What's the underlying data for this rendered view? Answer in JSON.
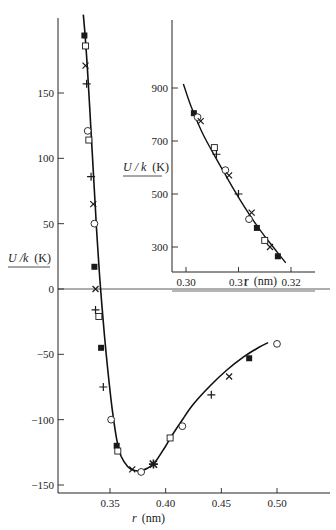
{
  "chart_data": [
    {
      "id": "main",
      "type": "scatter",
      "title": "",
      "xlabel": "r (nm)",
      "ylabel": "U / k (K)",
      "xlim": [
        0.305,
        0.525
      ],
      "ylim": [
        -150,
        205
      ],
      "xticks": [
        0.35,
        0.4,
        0.45,
        0.5
      ],
      "xtick_labels": [
        "0.35",
        "0.40",
        "0.45",
        "0.50"
      ],
      "yticks": [
        150,
        100,
        50,
        0,
        -50,
        -100,
        -150
      ],
      "ytick_labels": [
        "150",
        "100",
        "50",
        "0",
        "−50",
        "−100",
        "−150"
      ],
      "grid": false,
      "zero_line": true,
      "curve": {
        "description": "smooth fitted potential curve through all points",
        "x": [
          0.326,
          0.328,
          0.33,
          0.332,
          0.334,
          0.336,
          0.338,
          0.34,
          0.342,
          0.345,
          0.348,
          0.352,
          0.356,
          0.36,
          0.366,
          0.372,
          0.378,
          0.384,
          0.39,
          0.398,
          0.405,
          0.415,
          0.425,
          0.44,
          0.455,
          0.47,
          0.483,
          0.492
        ],
        "y": [
          210,
          190,
          165,
          135,
          105,
          75,
          45,
          18,
          -5,
          -35,
          -62,
          -92,
          -115,
          -128,
          -136,
          -139,
          -139,
          -137,
          -133,
          -123,
          -113,
          -100,
          -88,
          -74,
          -62,
          -52,
          -45,
          -41
        ]
      },
      "series": [
        {
          "name": "filled-square",
          "marker": "filled-square",
          "x": [
            0.327,
            0.336,
            0.342,
            0.356,
            0.475
          ],
          "y": [
            194,
            17,
            -45,
            -120,
            -53
          ]
        },
        {
          "name": "open-square",
          "marker": "open-square",
          "x": [
            0.328,
            0.331,
            0.34,
            0.357,
            0.404
          ],
          "y": [
            186,
            114,
            -21,
            -124,
            -114
          ]
        },
        {
          "name": "cross",
          "marker": "cross",
          "x": [
            0.328,
            0.335,
            0.337,
            0.37,
            0.457
          ],
          "y": [
            171,
            65,
            0,
            -138,
            -67
          ]
        },
        {
          "name": "plus",
          "marker": "plus",
          "x": [
            0.329,
            0.333,
            0.337,
            0.344,
            0.441
          ],
          "y": [
            157,
            86,
            -16,
            -75,
            -81
          ]
        },
        {
          "name": "open-circle",
          "marker": "open-circle",
          "x": [
            0.33,
            0.336,
            0.351,
            0.378,
            0.415,
            0.5
          ],
          "y": [
            121,
            50,
            -100,
            -140,
            -105,
            -42
          ]
        },
        {
          "name": "asterisk",
          "marker": "asterisk",
          "x": [
            0.389
          ],
          "y": [
            -134
          ]
        }
      ]
    },
    {
      "id": "inset",
      "type": "scatter",
      "title": "",
      "xlabel": "r (nm)",
      "ylabel": "U / k (K)",
      "xlim": [
        0.297,
        0.325
      ],
      "ylim": [
        250,
        1010
      ],
      "xticks": [
        0.3,
        0.31,
        0.32
      ],
      "xtick_labels": [
        "0.30",
        "0.31",
        "0.32"
      ],
      "yticks": [
        900,
        700,
        500,
        300
      ],
      "ytick_labels": [
        "900",
        "700",
        "500",
        "300"
      ],
      "grid": false,
      "curve": {
        "x": [
          0.2995,
          0.301,
          0.303,
          0.305,
          0.307,
          0.309,
          0.311,
          0.313,
          0.315,
          0.317,
          0.319
        ],
        "y": [
          915,
          828,
          735,
          660,
          590,
          520,
          455,
          395,
          340,
          290,
          240
        ]
      },
      "series": [
        {
          "name": "filled-square",
          "marker": "filled-square",
          "x": [
            0.3015,
            0.3135,
            0.3175
          ],
          "y": [
            805,
            372,
            265
          ]
        },
        {
          "name": "open-circle",
          "marker": "open-circle",
          "x": [
            0.3022,
            0.3075,
            0.312
          ],
          "y": [
            790,
            590,
            405
          ]
        },
        {
          "name": "open-square",
          "marker": "open-square",
          "x": [
            0.3054,
            0.315
          ],
          "y": [
            675,
            325
          ]
        },
        {
          "name": "cross",
          "marker": "cross",
          "x": [
            0.3028,
            0.3082,
            0.3125,
            0.316
          ],
          "y": [
            775,
            570,
            430,
            300
          ]
        },
        {
          "name": "plus",
          "marker": "plus",
          "x": [
            0.3058,
            0.31
          ],
          "y": [
            650,
            500
          ]
        }
      ]
    }
  ],
  "labels": {
    "main_ylabel_var": "U /k",
    "main_ylabel_unit": "(K)",
    "main_xlabel_var": "r",
    "main_xlabel_unit": "(nm)",
    "inset_ylabel_var": "U / k",
    "inset_ylabel_unit": "(K)",
    "inset_xlabel_var": "r",
    "inset_xlabel_unit": "(nm)"
  },
  "colors": {
    "ink": "#1a1a1a",
    "background": "#ffffff"
  }
}
